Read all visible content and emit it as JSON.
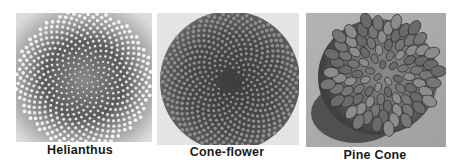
{
  "figure": {
    "panels": [
      {
        "id": "helianthus",
        "caption": "Helianthus",
        "subject": "sunflower seed head with spiral phyllotaxis",
        "background": "#b8b8b8",
        "center_color": "#4a4a4a",
        "seed_color": "#e2e2e2"
      },
      {
        "id": "cone-flower",
        "caption": "Cone-flower",
        "subject": "coneflower center with spiky spiral florets",
        "background": "#d8d8d8",
        "center_color": "#3a3a3a",
        "seed_color": "#9a9a9a"
      },
      {
        "id": "pine-cone",
        "caption": "Pine Cone",
        "subject": "pine cone viewed from base showing spiral scales",
        "background": "#a8a8a8",
        "center_color": "#5a5a5a",
        "seed_color": "#7c7c7c"
      }
    ]
  }
}
